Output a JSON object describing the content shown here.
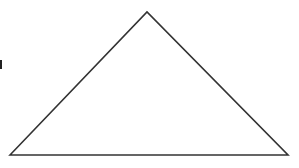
{
  "diagram": {
    "type": "triangle",
    "shape": "isosceles-obtuse",
    "vertices": {
      "left": [
        10,
        155
      ],
      "apex": [
        147,
        12
      ],
      "right": [
        288,
        155
      ]
    },
    "stroke_color": "#333333",
    "fill_color": "#ffffff",
    "stroke_width": 1.6
  },
  "background": "#ffffff"
}
